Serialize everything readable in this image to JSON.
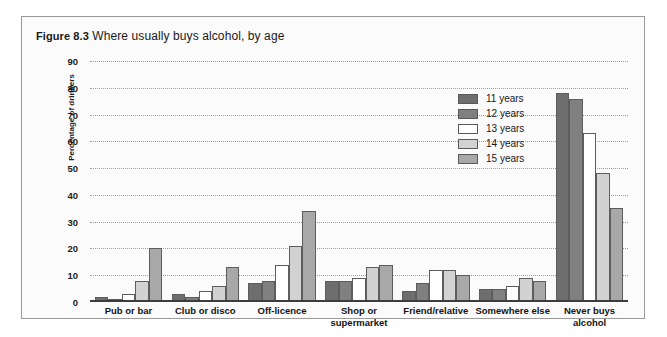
{
  "figure": {
    "number": "Figure 8.3",
    "caption": "Where usually buys alcohol, by age"
  },
  "colors": {
    "frame_border": "#9a9a9a",
    "panel_background": "#fbfbfb",
    "gridline": "#9e9e9e",
    "axis": "#3d3d3d",
    "bar_outline": "#5d5d5d",
    "series_11_years": "#6e6e6e",
    "series_12_years": "#808080",
    "series_13_years": "#ffffff",
    "series_14_years": "#d2d2d2",
    "series_15_years": "#a8a8a8"
  },
  "legend": {
    "position": "inside-top-right",
    "items": [
      {
        "label": "11 years",
        "color": "#6e6e6e"
      },
      {
        "label": "12 years",
        "color": "#808080"
      },
      {
        "label": "13 years",
        "color": "#ffffff"
      },
      {
        "label": "14 years",
        "color": "#d2d2d2"
      },
      {
        "label": "15 years",
        "color": "#a8a8a8"
      }
    ]
  },
  "chart_data": {
    "type": "bar",
    "title": "Figure 8.3 Where usually buys alcohol, by age",
    "xlabel": "",
    "ylabel": "Percentage of drinkers",
    "ylim": [
      0,
      90
    ],
    "yticks": [
      0,
      10,
      20,
      30,
      40,
      50,
      60,
      70,
      80,
      90
    ],
    "grid": true,
    "legend_position": "inside-top-right",
    "categories": [
      "Pub or bar",
      "Club or disco",
      "Off-licence",
      "Shop or supermarket",
      "Friend/relative",
      "Somewhere else",
      "Never buys alcohol"
    ],
    "series": [
      {
        "name": "11 years",
        "color": "#6e6e6e",
        "values": [
          2,
          3,
          7,
          8,
          4,
          5,
          78
        ]
      },
      {
        "name": "12 years",
        "color": "#808080",
        "values": [
          1,
          2,
          8,
          8,
          7,
          5,
          76
        ]
      },
      {
        "name": "13 years",
        "color": "#ffffff",
        "values": [
          3,
          4,
          14,
          9,
          12,
          6,
          63
        ]
      },
      {
        "name": "14 years",
        "color": "#d2d2d2",
        "values": [
          8,
          6,
          21,
          13,
          12,
          9,
          48
        ]
      },
      {
        "name": "15 years",
        "color": "#a8a8a8",
        "values": [
          20,
          13,
          34,
          14,
          10,
          8,
          35
        ]
      }
    ]
  }
}
